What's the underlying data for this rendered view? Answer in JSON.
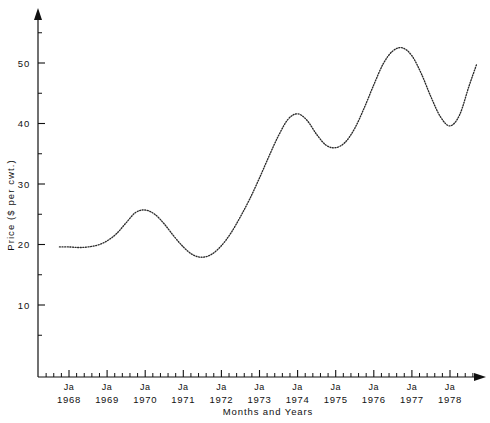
{
  "chart_data": {
    "type": "line",
    "title": "",
    "xlabel": "Months and Years",
    "ylabel": "Price ($ per cwt.)",
    "ylim": [
      0,
      57
    ],
    "xlim": [
      1967.58,
      1978.83
    ],
    "grid": false,
    "legend": false,
    "line_style": "dotted",
    "y_ticks_major": [
      10,
      20,
      30,
      40,
      50
    ],
    "y_tick_labels": [
      "10",
      "20",
      "30",
      "40",
      "50"
    ],
    "y_ticks_minor": [
      5,
      15,
      25,
      35,
      45,
      55
    ],
    "x_tick_month_label": "Ja",
    "x_tick_years": [
      "1968",
      "1969",
      "1970",
      "1971",
      "1972",
      "1973",
      "1974",
      "1975",
      "1976",
      "1977",
      "1978"
    ],
    "x_minor_ticks_per_year": 4,
    "axis_arrows": [
      "y-top",
      "x-right"
    ],
    "x": [
      1967.75,
      1968.0,
      1968.25,
      1968.5,
      1968.75,
      1969.0,
      1969.25,
      1969.5,
      1969.75,
      1970.0,
      1970.25,
      1970.5,
      1970.75,
      1971.0,
      1971.25,
      1971.5,
      1971.75,
      1972.0,
      1972.25,
      1972.5,
      1972.75,
      1973.0,
      1973.25,
      1973.5,
      1973.75,
      1974.0,
      1974.25,
      1974.5,
      1974.75,
      1975.0,
      1975.25,
      1975.5,
      1975.75,
      1976.0,
      1976.25,
      1976.5,
      1976.75,
      1977.0,
      1977.25,
      1977.5,
      1977.75,
      1978.0,
      1978.25,
      1978.5,
      1978.7
    ],
    "values": [
      19.6,
      19.6,
      19.5,
      19.6,
      19.9,
      20.6,
      21.8,
      23.6,
      25.3,
      25.7,
      25.0,
      23.4,
      21.4,
      19.6,
      18.3,
      17.9,
      18.4,
      19.8,
      21.9,
      24.6,
      27.6,
      31.0,
      34.6,
      38.0,
      40.7,
      41.6,
      40.5,
      38.2,
      36.4,
      36.0,
      36.9,
      39.2,
      42.6,
      46.4,
      49.9,
      52.0,
      52.5,
      51.2,
      48.2,
      44.4,
      41.1,
      39.6,
      41.4,
      46.2,
      49.8
    ],
    "annotations": []
  },
  "axes": {
    "y_axis_name": "price-axis",
    "x_axis_name": "time-axis"
  }
}
